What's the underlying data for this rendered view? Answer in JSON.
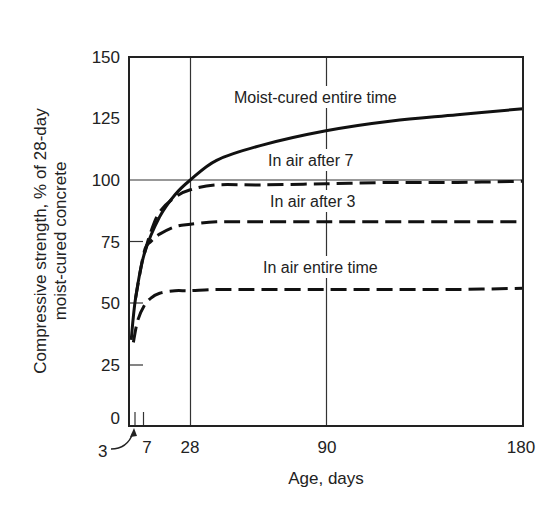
{
  "chart_data": {
    "type": "line",
    "title": "",
    "xlabel": "Age, days",
    "ylabel": "Compressive strength, % of 28-day moist-cured concrete",
    "ylabel_lines": [
      "Compressive strength, % of 28-day",
      "moist-cured concrete"
    ],
    "xlim": [
      0,
      180
    ],
    "ylim": [
      0,
      150
    ],
    "x_ticks": [
      3,
      7,
      28,
      90,
      180
    ],
    "x_tick_labels": [
      "3",
      "7",
      "28",
      "90",
      "180"
    ],
    "y_ticks": [
      0,
      25,
      50,
      75,
      100,
      125,
      150
    ],
    "y_tick_labels": [
      "0",
      "25",
      "50",
      "75",
      "100",
      "125",
      "150"
    ],
    "grid": {
      "vertical": [
        28,
        90
      ],
      "horizontal": [
        100
      ]
    },
    "legend": "inline labels",
    "annotations": [
      {
        "text": "3",
        "points_to_x": 3,
        "style": "curved arrow"
      }
    ],
    "series": [
      {
        "name": "Moist-cured entire time",
        "style": "solid",
        "x": [
          1,
          3,
          7,
          14,
          21,
          28,
          40,
          60,
          90,
          120,
          150,
          180
        ],
        "y": [
          35,
          52,
          70,
          85,
          94,
          100,
          108,
          114,
          120,
          124,
          126.5,
          129
        ]
      },
      {
        "name": "In air after 7",
        "style": "dashed",
        "x": [
          7,
          10,
          14,
          21,
          28,
          40,
          60,
          90,
          120,
          150,
          180
        ],
        "y": [
          70,
          79,
          87,
          93,
          96,
          98,
          98,
          98.5,
          99,
          99,
          99.5
        ]
      },
      {
        "name": "In air after 3",
        "style": "dashed",
        "x": [
          3,
          7,
          10,
          14,
          21,
          28,
          40,
          60,
          90,
          120,
          150,
          180
        ],
        "y": [
          52,
          71,
          75,
          78,
          81,
          82,
          83,
          83,
          83,
          83,
          83,
          83
        ]
      },
      {
        "name": "In air entire time",
        "style": "dashed",
        "x": [
          2,
          4,
          7,
          10,
          14,
          21,
          28,
          40,
          60,
          90,
          120,
          150,
          180
        ],
        "y": [
          34,
          43,
          49,
          52,
          54,
          55,
          55,
          55.5,
          55.5,
          55.5,
          55.5,
          55.5,
          56
        ]
      }
    ]
  },
  "labels": {
    "series_0": "Moist-cured entire time",
    "series_1": "In air after 7",
    "series_2": "In air after 3",
    "series_3": "In air entire time",
    "xlabel": "Age, days",
    "ylabel_line1": "Compressive strength, % of 28-day",
    "ylabel_line2": "moist-cured concrete",
    "arrow_annotation": "3",
    "x_tick_7": "7",
    "x_tick_28": "28",
    "x_tick_90": "90",
    "x_tick_180": "180",
    "y_tick_0": "0",
    "y_tick_25": "25",
    "y_tick_50": "50",
    "y_tick_75": "75",
    "y_tick_100": "100",
    "y_tick_125": "125",
    "y_tick_150": "150"
  }
}
